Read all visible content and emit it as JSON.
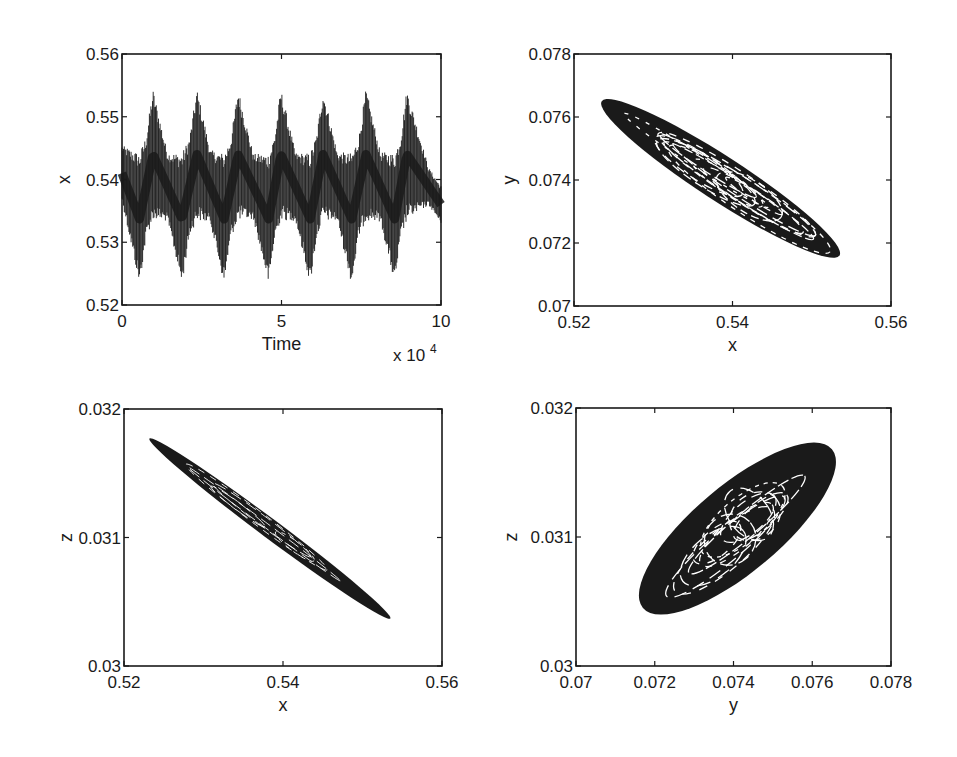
{
  "figure": {
    "background": "#ffffff",
    "ink_color": "#1a1a1a"
  },
  "chart_data": [
    {
      "id": "panel-time-series",
      "type": "line",
      "title": "",
      "xlabel": "Time",
      "ylabel": "x",
      "x_multiplier_label": "x 10",
      "x_multiplier_exponent": "4",
      "xlim": [
        0,
        10
      ],
      "ylim": [
        0.52,
        0.56
      ],
      "xticks": [
        0,
        5,
        10
      ],
      "xtick_labels": [
        "0",
        "5",
        "10"
      ],
      "yticks": [
        0.52,
        0.53,
        0.54,
        0.55,
        0.56
      ],
      "ytick_labels": [
        "0.52",
        "0.53",
        "0.54",
        "0.55",
        "0.56"
      ],
      "grid": false,
      "frame_px": {
        "left": 122,
        "top": 54,
        "right": 441,
        "bottom": 305
      },
      "series": [
        {
          "name": "x(t)",
          "description": "fast oscillation with slow triangular envelope, ~7 slow cycles",
          "slow_period": 1.35,
          "slow_peak_times": [
            0.97,
            2.35,
            3.64,
            4.98,
            6.3,
            7.65,
            8.93
          ],
          "slow_trough_times": [
            0.55,
            1.88,
            3.2,
            4.6,
            5.9,
            7.2,
            8.55
          ],
          "mean": 0.5385,
          "envelope_max": 0.5545,
          "envelope_min": 0.5228,
          "start_value": 0.541,
          "end_value": 0.525
        }
      ]
    },
    {
      "id": "panel-x-y",
      "type": "scatter",
      "title": "",
      "xlabel": "x",
      "ylabel": "y",
      "xlim": [
        0.52,
        0.56
      ],
      "ylim": [
        0.07,
        0.078
      ],
      "xticks": [
        0.52,
        0.54,
        0.56
      ],
      "xtick_labels": [
        "0.52",
        "0.54",
        "0.56"
      ],
      "yticks": [
        0.07,
        0.072,
        0.074,
        0.076,
        0.078
      ],
      "ytick_labels": [
        "0.07",
        "0.072",
        "0.074",
        "0.076",
        "0.078"
      ],
      "grid": false,
      "frame_px": {
        "left": 574,
        "top": 54,
        "right": 891,
        "bottom": 306
      },
      "series": [
        {
          "name": "phase portrait x-y",
          "description": "elongated torus-like attractor, negative slope",
          "end_a": [
            0.5235,
            0.0765
          ],
          "end_b": [
            0.5535,
            0.0716
          ],
          "center": [
            0.5385,
            0.074
          ],
          "half_width_x_units": 0.0028
        }
      ]
    },
    {
      "id": "panel-x-z",
      "type": "scatter",
      "title": "",
      "xlabel": "x",
      "ylabel": "z",
      "xlim": [
        0.52,
        0.56
      ],
      "ylim": [
        0.03,
        0.032
      ],
      "xticks": [
        0.52,
        0.54,
        0.56
      ],
      "xtick_labels": [
        "0.52",
        "0.54",
        "0.56"
      ],
      "yticks": [
        0.03,
        0.031,
        0.032
      ],
      "ytick_labels": [
        "0.03",
        "0.031",
        "0.032"
      ],
      "grid": false,
      "frame_px": {
        "left": 124,
        "top": 409,
        "right": 442,
        "bottom": 666
      },
      "series": [
        {
          "name": "phase portrait x-z",
          "description": "very thin elongated attractor, negative slope",
          "end_a": [
            0.5232,
            0.03177
          ],
          "end_b": [
            0.5535,
            0.03037
          ],
          "center": [
            0.5384,
            0.03107
          ],
          "half_width_x_units": 0.0012
        }
      ]
    },
    {
      "id": "panel-y-z",
      "type": "scatter",
      "title": "",
      "xlabel": "y",
      "ylabel": "z",
      "xlim": [
        0.07,
        0.078
      ],
      "ylim": [
        0.03,
        0.032
      ],
      "xticks": [
        0.07,
        0.072,
        0.074,
        0.076,
        0.078
      ],
      "xtick_labels": [
        "0.07",
        "0.072",
        "0.074",
        "0.076",
        "0.078"
      ],
      "yticks": [
        0.03,
        0.031,
        0.032
      ],
      "ytick_labels": [
        "0.03",
        "0.031",
        "0.032"
      ],
      "grid": false,
      "frame_px": {
        "left": 576,
        "top": 408,
        "right": 891,
        "bottom": 666
      },
      "series": [
        {
          "name": "phase portrait y-z",
          "description": "broad elliptical attractor with concentric loops, positive slope",
          "end_a": [
            0.0717,
            0.03045
          ],
          "end_b": [
            0.0765,
            0.03168
          ],
          "center": [
            0.0741,
            0.03107
          ],
          "half_width_x_units": 0.0011
        }
      ]
    }
  ]
}
